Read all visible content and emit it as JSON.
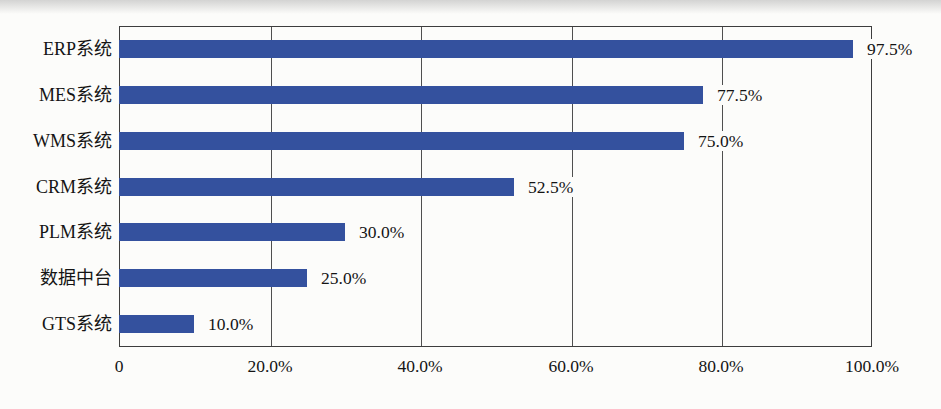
{
  "chart_data": {
    "type": "bar",
    "orientation": "horizontal",
    "title": "",
    "xlabel": "",
    "ylabel": "",
    "categories": [
      "ERP系统",
      "MES系统",
      "WMS系统",
      "CRM系统",
      "PLM系统",
      "数据中台",
      "GTS系统"
    ],
    "values": [
      97.5,
      77.5,
      75.0,
      52.5,
      30.0,
      25.0,
      10.0
    ],
    "value_labels": [
      "97.5%",
      "77.5%",
      "75.0%",
      "52.5%",
      "30.0%",
      "25.0%",
      "10.0%"
    ],
    "x_ticks": [
      {
        "value": 0,
        "label": "0"
      },
      {
        "value": 20,
        "label": "20.0%"
      },
      {
        "value": 40,
        "label": "40.0%"
      },
      {
        "value": 60,
        "label": "60.0%"
      },
      {
        "value": 80,
        "label": "80.0%"
      },
      {
        "value": 100,
        "label": "100.0%"
      }
    ],
    "xlim": [
      0,
      100
    ],
    "grid": "vertical-only",
    "legend": "none",
    "colors": {
      "bar": "#34519e",
      "plot_border": "#3d3d3d",
      "gridline": "#4f4f4f",
      "text": "#141414",
      "background": "#fcfcfa"
    }
  }
}
